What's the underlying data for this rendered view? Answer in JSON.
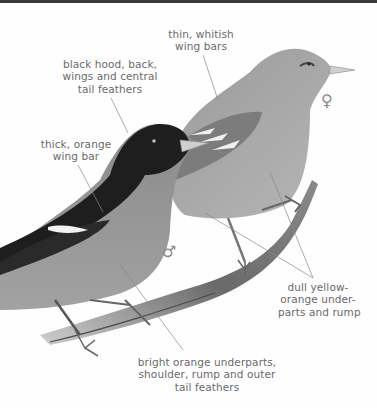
{
  "figure": {
    "colors": {
      "ink": "#6a6a6a",
      "background": "#fefefe",
      "topbar": "#3a3a3a"
    }
  },
  "labels": {
    "female_wing_bars": [
      "thin, whitish",
      "wing bars"
    ],
    "male_hood": [
      "black hood, back,",
      "wings and central",
      "tail feathers"
    ],
    "male_wing_bar": [
      "thick, orange",
      "wing bar"
    ],
    "female_underparts": [
      "dull yellow-",
      "orange under-",
      "parts and rump"
    ],
    "male_underparts": [
      "bright orange underparts,",
      "shoulder, rump and outer",
      "tail feathers"
    ]
  },
  "symbols": {
    "female": "♀",
    "male": "♂"
  }
}
